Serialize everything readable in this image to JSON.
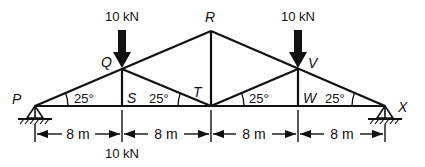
{
  "diagram": {
    "type": "roof truss",
    "colors": {
      "stroke": "#111111",
      "background": "#ffffff"
    },
    "nodes": {
      "P": "P",
      "Q": "Q",
      "R": "R",
      "S": "S",
      "T": "T",
      "V": "V",
      "W": "W",
      "X": "X"
    },
    "angles": [
      "25°",
      "25°",
      "25°",
      "25°"
    ],
    "loads": {
      "at_Q": "10 kN",
      "at_V": "10 kN",
      "at_S": "10 kN"
    },
    "dimensions": [
      "8 m",
      "8 m",
      "8 m",
      "8 m"
    ],
    "supports": {
      "left": "pin-support-icon",
      "right": "pin-support-icon"
    }
  }
}
